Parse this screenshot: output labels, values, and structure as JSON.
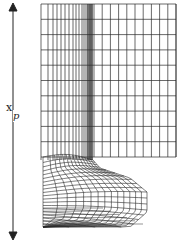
{
  "figure": {
    "type": "computational-mesh",
    "dimension_arrow": {
      "label_main": "x",
      "label_sub": "p",
      "direction": "vertical-double-headed"
    },
    "colors": {
      "line": "#2a2a2a",
      "background": "#ffffff"
    }
  }
}
